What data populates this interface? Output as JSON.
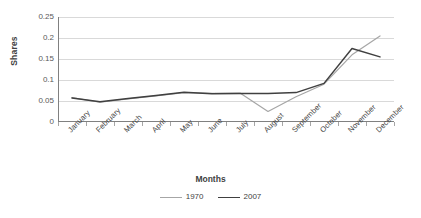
{
  "chart_data": {
    "type": "line",
    "title": "",
    "xlabel": "Months",
    "ylabel": "Shares",
    "categories": [
      "January",
      "February",
      "March",
      "April",
      "May",
      "June",
      "July",
      "August",
      "September",
      "October",
      "November",
      "December"
    ],
    "series": [
      {
        "name": "1970",
        "color": "#a6a6a6",
        "values": [
          0.058,
          0.047,
          0.055,
          0.062,
          0.07,
          0.068,
          0.069,
          0.025,
          0.06,
          0.09,
          0.16,
          0.205
        ]
      },
      {
        "name": "2007",
        "color": "#404040",
        "values": [
          0.057,
          0.048,
          0.056,
          0.063,
          0.071,
          0.067,
          0.068,
          0.068,
          0.07,
          0.092,
          0.175,
          0.155
        ]
      }
    ],
    "ylim": [
      0,
      0.25
    ],
    "yticks": [
      "0",
      "0.05",
      "0.1",
      "0.15",
      "0.2",
      "0.25"
    ],
    "ytick_values": [
      0,
      0.05,
      0.1,
      0.15,
      0.2,
      0.25
    ],
    "grid": true,
    "legend_position": "bottom"
  },
  "axes": {
    "y_title": "Shares",
    "x_title": "Months"
  },
  "colors": {
    "series_1970": "#a6a6a6",
    "series_2007": "#404040",
    "gridline": "#d9d9d9",
    "axis": "#808080",
    "text": "#3f3f3f",
    "background": "#ffffff"
  }
}
